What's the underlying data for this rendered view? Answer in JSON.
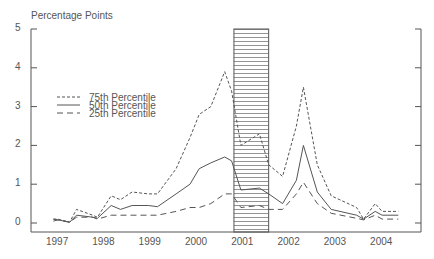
{
  "chart_data": {
    "type": "line",
    "title": "",
    "ylabel": "Percentage Points",
    "xlabel": "",
    "ylim": [
      0,
      5
    ],
    "yticks": [
      "0",
      "1",
      "2",
      "3",
      "4",
      "5"
    ],
    "xticks": [
      "1997",
      "1998",
      "1999",
      "2000",
      "2001",
      "2002",
      "2003",
      "2004"
    ],
    "grid": false,
    "legend_position": "upper-left",
    "shaded_region": {
      "x_start": 2000.8,
      "x_end": 2001.55,
      "pattern": "hatched"
    },
    "series": [
      {
        "name": "75th Percentile",
        "style": "short-dash",
        "x": [
          1996.9,
          1997.0,
          1997.25,
          1997.4,
          1997.75,
          1997.85,
          1998.15,
          1998.35,
          1998.6,
          1998.95,
          1999.15,
          1999.55,
          1999.85,
          2000.05,
          2000.3,
          2000.6,
          2000.75,
          2000.95,
          2001.35,
          2001.55,
          2001.85,
          2002.15,
          2002.3,
          2002.6,
          2002.9,
          2003.45,
          2003.6,
          2003.85,
          2004.0,
          2004.35
        ],
        "values": [
          0.1,
          0.1,
          0.02,
          0.35,
          0.2,
          0.15,
          0.7,
          0.6,
          0.8,
          0.75,
          0.75,
          1.4,
          2.2,
          2.8,
          3.0,
          3.9,
          3.4,
          2.0,
          2.3,
          1.5,
          1.2,
          2.5,
          3.5,
          1.5,
          0.7,
          0.4,
          0.1,
          0.5,
          0.3,
          0.3
        ]
      },
      {
        "name": "50th Percentile",
        "style": "solid",
        "x": [
          1996.9,
          1997.0,
          1997.25,
          1997.4,
          1997.75,
          1997.85,
          1998.15,
          1998.35,
          1998.6,
          1998.95,
          1999.15,
          1999.55,
          1999.85,
          2000.05,
          2000.3,
          2000.6,
          2000.75,
          2000.95,
          2001.35,
          2001.55,
          2001.85,
          2002.15,
          2002.3,
          2002.6,
          2002.9,
          2003.45,
          2003.6,
          2003.85,
          2004.0,
          2004.35
        ],
        "values": [
          0.1,
          0.08,
          0.02,
          0.2,
          0.15,
          0.12,
          0.45,
          0.35,
          0.45,
          0.45,
          0.42,
          0.75,
          1.0,
          1.4,
          1.55,
          1.7,
          1.6,
          0.85,
          0.9,
          0.75,
          0.5,
          1.1,
          2.0,
          0.8,
          0.35,
          0.2,
          0.1,
          0.3,
          0.2,
          0.2
        ]
      },
      {
        "name": "25th Percentile",
        "style": "long-dash",
        "x": [
          1996.9,
          1997.0,
          1997.25,
          1997.4,
          1997.75,
          1997.85,
          1998.15,
          1998.35,
          1998.6,
          1998.95,
          1999.15,
          1999.55,
          1999.85,
          2000.05,
          2000.3,
          2000.6,
          2000.75,
          2000.95,
          2001.35,
          2001.55,
          2001.85,
          2002.15,
          2002.3,
          2002.6,
          2002.9,
          2003.45,
          2003.6,
          2003.85,
          2004.0,
          2004.35
        ],
        "values": [
          0.05,
          0.08,
          0.02,
          0.15,
          0.15,
          0.1,
          0.2,
          0.2,
          0.2,
          0.2,
          0.2,
          0.3,
          0.4,
          0.4,
          0.5,
          0.75,
          0.75,
          0.4,
          0.45,
          0.35,
          0.35,
          0.75,
          1.05,
          0.5,
          0.25,
          0.12,
          0.08,
          0.2,
          0.1,
          0.1
        ]
      }
    ]
  },
  "axis": {
    "ylabel": "Percentage Points"
  },
  "legend": [
    {
      "label": "75th Percentile"
    },
    {
      "label": "50th Percentile"
    },
    {
      "label": "25th Percentile"
    }
  ],
  "colors": {
    "line": "#555555",
    "axis": "#555555",
    "hatch": "#666666"
  }
}
